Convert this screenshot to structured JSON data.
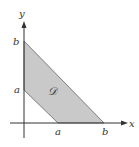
{
  "diagram": {
    "type": "region-in-plane",
    "axes": {
      "x_label": "x",
      "y_label": "y"
    },
    "region": {
      "label": "𝒟",
      "vertices_math": [
        [
          "0",
          "a"
        ],
        [
          "0",
          "b"
        ],
        [
          "b",
          "0"
        ],
        [
          "a",
          "0"
        ]
      ],
      "fill_color": "#c9c9c9",
      "edge_color": "#555555"
    },
    "ticks": {
      "y_axis": [
        "b",
        "a"
      ],
      "x_axis": [
        "a",
        "b"
      ]
    }
  }
}
